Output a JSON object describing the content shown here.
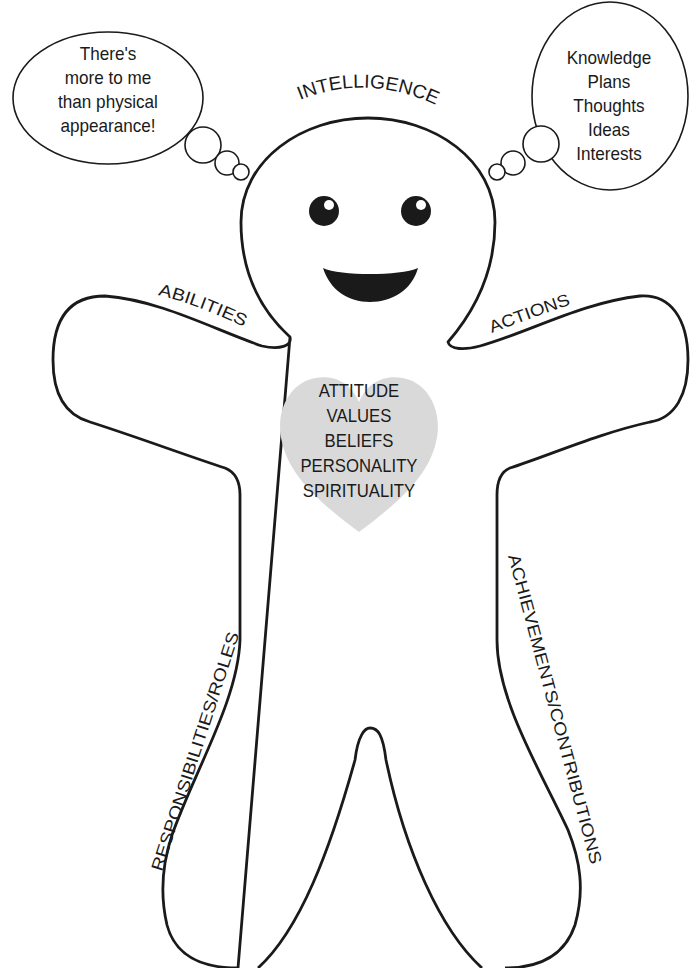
{
  "diagram": {
    "type": "self-concept figure",
    "figure": "gingerbread person outline",
    "colors": {
      "outline": "#1a1a1a",
      "heart_fill": "#d9d9d9",
      "background": "#ffffff"
    }
  },
  "thought_bubbles": {
    "left": {
      "lines": [
        "There's",
        "more to me",
        "than physical",
        "appearance!"
      ]
    },
    "right": {
      "lines": [
        "Knowledge",
        "Plans",
        "Thoughts",
        "Ideas",
        "Interests"
      ]
    }
  },
  "body_labels": {
    "head": "INTELLIGENCE",
    "left_arm": "ABILITIES",
    "right_arm": "ACTIONS",
    "left_leg": "RESPONSIBILITIES/ROLES",
    "right_leg": "ACHIEVEMENTS/CONTRIBUTIONS"
  },
  "heart": {
    "lines": [
      "ATTITUDE",
      "VALUES",
      "BELIEFS",
      "PERSONALITY",
      "SPIRITUALITY"
    ]
  }
}
